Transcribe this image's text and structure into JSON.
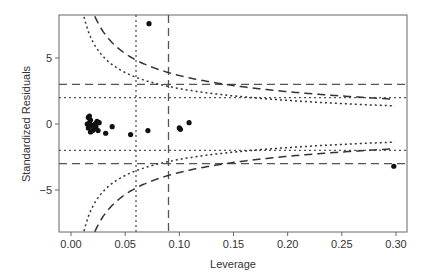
{
  "chart_data": {
    "type": "scatter",
    "title": "",
    "xlabel": "Leverage",
    "ylabel": "Standardized Residuals",
    "xlim": [
      -0.012,
      0.31
    ],
    "ylim": [
      -8.2,
      8.2
    ],
    "x_ticks": [
      "0.00",
      "0.05",
      "0.10",
      "0.15",
      "0.20",
      "0.25",
      "0.30"
    ],
    "x_tick_values": [
      0.0,
      0.05,
      0.1,
      0.15,
      0.2,
      0.25,
      0.3
    ],
    "y_ticks": [
      "-5",
      "0",
      "5"
    ],
    "y_tick_values": [
      -5,
      0,
      5
    ],
    "grid": false,
    "legend": null,
    "reference_lines": {
      "horizontal_dashed": [
        3,
        -3
      ],
      "horizontal_dotted": [
        2,
        -2
      ],
      "vertical_dotted": [
        0.06
      ],
      "vertical_dashed": [
        0.09
      ],
      "cooks_curves": [
        {
          "style": "dotted",
          "description": "Cook's distance contour (inner)",
          "sign": "both"
        },
        {
          "style": "dashed",
          "description": "Cook's distance contour (outer)",
          "sign": "both"
        }
      ]
    },
    "series": [
      {
        "name": "observations",
        "points": [
          [
            0.072,
            7.6
          ],
          [
            0.016,
            0.5
          ],
          [
            0.018,
            0.3
          ],
          [
            0.017,
            0.1
          ],
          [
            0.019,
            -0.1
          ],
          [
            0.016,
            -0.3
          ],
          [
            0.02,
            -0.5
          ],
          [
            0.022,
            0.0
          ],
          [
            0.024,
            0.2
          ],
          [
            0.018,
            -0.6
          ],
          [
            0.021,
            -0.4
          ],
          [
            0.015,
            0.0
          ],
          [
            0.023,
            -0.2
          ],
          [
            0.026,
            0.1
          ],
          [
            0.017,
            0.6
          ],
          [
            0.025,
            -0.5
          ],
          [
            0.032,
            -0.7
          ],
          [
            0.038,
            -0.2
          ],
          [
            0.055,
            -0.8
          ],
          [
            0.071,
            -0.5
          ],
          [
            0.1,
            -0.3
          ],
          [
            0.101,
            -0.4
          ],
          [
            0.109,
            0.1
          ],
          [
            0.298,
            -3.2
          ]
        ]
      }
    ]
  }
}
